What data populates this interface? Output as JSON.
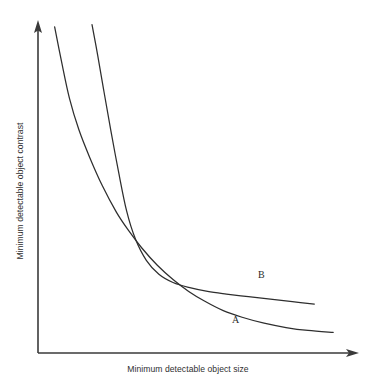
{
  "chart_data": {
    "type": "line",
    "title": "",
    "subtitle": "",
    "xlabel": "Minimum detectable object size",
    "ylabel": "Minimum detectable object contrast",
    "grid": false,
    "legend_position": "inline-annotations",
    "axes": {
      "x_arrow": true,
      "y_arrow": true,
      "x_tick_labels": [],
      "y_tick_labels": [],
      "xlim": [
        0,
        1
      ],
      "ylim": [
        0,
        1
      ],
      "note": "Schematic axes, unitless and untick-labeled; both axes drawn as arrows increasing rightward and upward."
    },
    "annotations": [
      {
        "name": "curve-a-label",
        "text": "A",
        "x": 0.62,
        "y": 0.09
      },
      {
        "name": "curve-b-label",
        "text": "B",
        "x": 0.7,
        "y": 0.23
      }
    ],
    "series": [
      {
        "name": "A",
        "label": "A",
        "color": "#2e2e2e",
        "description": "Hyperbolic decay curve; starts high and far left, falls steeply, crosses curve B, then flattens to the lowest asymptote.",
        "x": [
          0.053,
          0.075,
          0.1,
          0.13,
          0.165,
          0.205,
          0.25,
          0.29,
          0.33,
          0.38,
          0.43,
          0.48,
          0.53,
          0.59,
          0.65,
          0.72,
          0.79,
          0.86,
          0.94
        ],
        "y": [
          0.985,
          0.88,
          0.77,
          0.675,
          0.59,
          0.505,
          0.425,
          0.368,
          0.318,
          0.265,
          0.222,
          0.186,
          0.157,
          0.128,
          0.108,
          0.09,
          0.077,
          0.068,
          0.062
        ]
      },
      {
        "name": "B",
        "label": "B",
        "color": "#2e2e2e",
        "description": "Steeper hyperbolic decay starting further right; crosses curve A near x=0.29 then flattens to a higher asymptote than A, declining slowly.",
        "x": [
          0.172,
          0.19,
          0.21,
          0.232,
          0.256,
          0.282,
          0.31,
          0.345,
          0.385,
          0.43,
          0.48,
          0.54,
          0.6,
          0.67,
          0.74,
          0.81,
          0.88
        ],
        "y": [
          0.992,
          0.9,
          0.79,
          0.672,
          0.55,
          0.43,
          0.345,
          0.28,
          0.238,
          0.213,
          0.198,
          0.186,
          0.178,
          0.17,
          0.163,
          0.155,
          0.148
        ]
      }
    ]
  },
  "figure": {
    "background_color": "#ffffff",
    "axis_color": "#3a3a3a",
    "curve_color": "#2e2e2e",
    "text_color": "#2f2f2f"
  }
}
